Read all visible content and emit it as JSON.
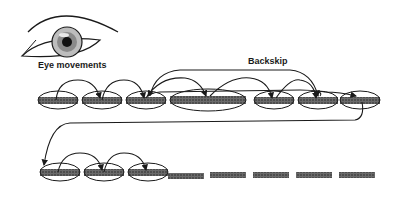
{
  "labels": {
    "eye": "Eye movements",
    "backskip": "Backskip"
  },
  "colors": {
    "ink": "#1a1a1a",
    "word_fill": "#555555",
    "background": "#ffffff"
  },
  "line1": {
    "fixations": [
      {
        "cx": 58,
        "rx": 20
      },
      {
        "cx": 102,
        "rx": 20
      },
      {
        "cx": 146,
        "rx": 20
      },
      {
        "cx": 208,
        "rx": 38
      },
      {
        "cx": 274,
        "rx": 20
      },
      {
        "cx": 318,
        "rx": 20
      },
      {
        "cx": 360,
        "rx": 20
      }
    ]
  },
  "line2": {
    "fixations": [
      {
        "cx": 60,
        "rx": 20
      },
      {
        "cx": 104,
        "rx": 20
      },
      {
        "cx": 148,
        "rx": 20
      }
    ],
    "unread_words": 5
  }
}
